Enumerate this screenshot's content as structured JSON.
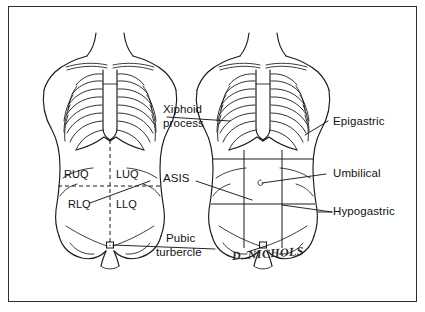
{
  "plate": {
    "title": "Abdominal surface landmarks and regions",
    "border_color": "#2e2e2e",
    "page_background": "#c9c9c9",
    "plate_background": "#ffffff",
    "ink_color": "#111111"
  },
  "left_figure": {
    "name": "four-quadrant-torso",
    "scheme": "four quadrants",
    "divider_style": "dashed",
    "quadrants": [
      {
        "key": "ruq",
        "label": "RUQ"
      },
      {
        "key": "luq",
        "label": "LUQ"
      },
      {
        "key": "rlq",
        "label": "RLQ"
      },
      {
        "key": "llq",
        "label": "LLQ"
      }
    ]
  },
  "right_figure": {
    "name": "nine-region-torso",
    "scheme": "nine regions",
    "divider_style": "solid",
    "umbilicus_marker": "c"
  },
  "center_labels": [
    {
      "key": "xiphoid",
      "line1": "Xiphoid",
      "line2": "process"
    },
    {
      "key": "asis",
      "line1": "ASIS",
      "line2": ""
    },
    {
      "key": "pubic",
      "line1": "Pubic",
      "line2": "turbercle"
    }
  ],
  "right_labels": [
    {
      "key": "epigastric",
      "label": "Epigastric"
    },
    {
      "key": "umbilical",
      "label": "Umbilical"
    },
    {
      "key": "hypogastric",
      "label": "Hypogastric"
    }
  ],
  "signature": {
    "text": "D. NICHOLS"
  }
}
